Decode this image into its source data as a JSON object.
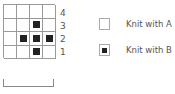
{
  "chart": {
    "rows": [
      {
        "label": "4",
        "cells": [
          0,
          0,
          0,
          0
        ]
      },
      {
        "label": "3",
        "cells": [
          0,
          0,
          1,
          0
        ]
      },
      {
        "label": "2",
        "cells": [
          0,
          1,
          1,
          1
        ]
      },
      {
        "label": "1",
        "cells": [
          0,
          0,
          1,
          0
        ]
      }
    ],
    "columns": 4
  },
  "row_labels": [
    "4",
    "3",
    "2",
    "1"
  ],
  "legend": [
    {
      "symbol": "empty-square",
      "label": "Knit with A"
    },
    {
      "symbol": "filled-square",
      "label": "Knit with B"
    }
  ],
  "repeat_bracket": {
    "spans_columns": 4
  },
  "colors": {
    "fill_b": "#222222",
    "grid_line": "#9a9a9a",
    "text": "#555555"
  }
}
